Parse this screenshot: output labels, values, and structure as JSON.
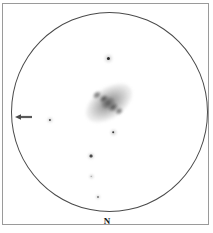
{
  "sketch": {
    "title": "Eyepiece field sketch",
    "field_of_view": {
      "shape": "circle",
      "center_x": 109.5,
      "center_y": 112,
      "radius_x": 98.5,
      "radius_y": 100,
      "border_color": "#4a4a4a"
    },
    "frame": {
      "border_color": "#9a9a9a",
      "background_color": "#ffffff"
    },
    "direction_label": {
      "text": "N",
      "x": 107,
      "y": 221,
      "color": "#141414"
    },
    "arrow_marker": {
      "name": "left-pointing-arrow",
      "x": 24,
      "y": 116,
      "direction": "left",
      "length": 14,
      "color": "#5a5a5a"
    },
    "galaxy": {
      "name": "irregular-galaxy",
      "center_x": 109,
      "center_y": 103,
      "halo_width": 52,
      "halo_height": 30,
      "rotation_deg": -35,
      "halo_color": "#9a9a9a",
      "knots": [
        {
          "x": 104,
          "y": 99,
          "w": 9,
          "h": 7,
          "color": "#3c3c3c"
        },
        {
          "x": 113,
          "y": 107,
          "w": 10,
          "h": 8,
          "color": "#474747"
        },
        {
          "x": 97,
          "y": 95,
          "w": 8,
          "h": 6,
          "color": "#6a6a6a"
        },
        {
          "x": 119,
          "y": 111,
          "w": 7,
          "h": 6,
          "color": "#6f6f6f"
        },
        {
          "x": 108,
          "y": 103,
          "w": 14,
          "h": 10,
          "color": "#555555"
        }
      ]
    },
    "stars": [
      {
        "id": "star-north",
        "x": 108,
        "y": 58,
        "core": 3.2,
        "halo": 9,
        "color": "#2b2b2b"
      },
      {
        "id": "star-west",
        "x": 50,
        "y": 120,
        "core": 2.2,
        "halo": 6,
        "color": "#4a4a4a"
      },
      {
        "id": "star-south-galaxy",
        "x": 113,
        "y": 132,
        "core": 2.6,
        "halo": 7,
        "color": "#3a3a3a"
      },
      {
        "id": "star-chain-upper",
        "x": 91,
        "y": 156,
        "core": 2.4,
        "halo": 6.5,
        "color": "#4a4a4a"
      },
      {
        "id": "star-chain-middle",
        "x": 91,
        "y": 176,
        "core": 1.6,
        "halo": 5,
        "color": "#7a7a7a"
      },
      {
        "id": "star-chain-lower",
        "x": 98,
        "y": 197,
        "core": 1.5,
        "halo": 4.5,
        "color": "#8a8a8a"
      }
    ]
  }
}
